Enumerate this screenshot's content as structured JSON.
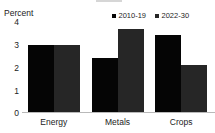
{
  "chart_data": {
    "type": "bar",
    "title": "",
    "xlabel": "",
    "ylabel": "Percent",
    "categories": [
      "Energy",
      "Metals",
      "Crops"
    ],
    "series": [
      {
        "name": "2010-19",
        "color": "#050505",
        "values": [
          2.75,
          2.2,
          3.15
        ]
      },
      {
        "name": "2022-30",
        "color": "#262626",
        "values": [
          2.75,
          3.4,
          1.9
        ]
      }
    ],
    "ylim": [
      0,
      4
    ],
    "yticks": [
      "4",
      "3",
      "2",
      "1",
      "0"
    ],
    "grid": false,
    "legend_position": "top-right"
  },
  "axis": {
    "unit_label": "Percent"
  }
}
